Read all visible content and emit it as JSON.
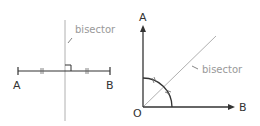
{
  "left_diagram": {
    "title": "perpendicular bisector of segment AB",
    "point_a_label": "A",
    "point_b_label": "B",
    "bisector_label": "bisector"
  },
  "right_diagram": {
    "title": "angle bisector of angle AOB",
    "point_a_label": "A",
    "point_b_label": "B",
    "origin_label": "O",
    "bisector_label": "bisector"
  },
  "colors": {
    "line": "#333333",
    "bisector_line": "#b0b0b0",
    "bisector_text": "#999999",
    "label": "#333333"
  }
}
